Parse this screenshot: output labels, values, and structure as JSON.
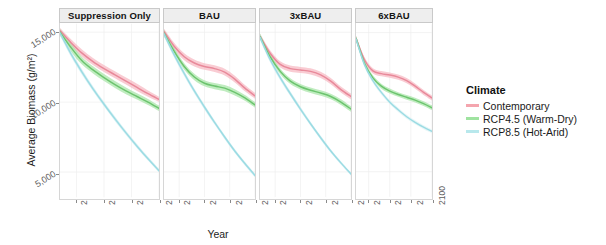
{
  "chart_data": {
    "type": "line",
    "title": "",
    "xlabel": "Year",
    "ylabel": "Average Biomass (g/m²)",
    "xlim": [
      2010,
      2100
    ],
    "ylim": [
      3200,
      15600
    ],
    "xticks": [
      "2025",
      "2050",
      "2075",
      "2100"
    ],
    "xtick_values": [
      2025,
      2050,
      2075,
      2100
    ],
    "yticks": [
      "15,000",
      "10,000",
      "5,000"
    ],
    "ytick_values": [
      15000,
      10000,
      5000
    ],
    "grid": true,
    "legend": {
      "title": "Climate",
      "position": "right",
      "entries": [
        {
          "label": "Contemporary",
          "color": "#f4a5ae"
        },
        {
          "label": "RCP4.5 (Warm-Dry)",
          "color": "#9fe3a0"
        },
        {
          "label": "RCP8.5 (Hot-Arid)",
          "color": "#b8e8ec"
        }
      ]
    },
    "facet_variable": "Harvest Scenario",
    "facets": [
      {
        "label": "Suppression Only",
        "series": [
          {
            "name": "Contemporary",
            "color": "#e8899a",
            "band_color": "#f6b8c2",
            "x": [
              2010,
              2020,
              2030,
              2040,
              2050,
              2060,
              2070,
              2080,
              2090,
              2100
            ],
            "values": [
              15100,
              14250,
              13500,
              12900,
              12400,
              11950,
              11500,
              11050,
              10600,
              10200
            ],
            "band_low": [
              14900,
              14000,
              13250,
              12650,
              12150,
              11700,
              11250,
              10800,
              10380,
              10020
            ],
            "band_high": [
              15300,
              14500,
              13760,
              13160,
              12660,
              12210,
              11760,
              11310,
              10830,
              10390
            ]
          },
          {
            "name": "RCP4.5 (Warm-Dry)",
            "color": "#6cc46e",
            "band_color": "#a8e5a7",
            "x": [
              2010,
              2020,
              2030,
              2040,
              2050,
              2060,
              2070,
              2080,
              2090,
              2100
            ],
            "values": [
              15000,
              13900,
              12950,
              12300,
              11750,
              11250,
              10800,
              10400,
              10000,
              9550
            ],
            "band_low": [
              14750,
              13600,
              12680,
              12050,
              11510,
              11010,
              10570,
              10180,
              9790,
              9360
            ],
            "band_high": [
              15250,
              14200,
              13220,
              12560,
              12000,
              11500,
              11050,
              10640,
              10230,
              9760
            ]
          },
          {
            "name": "RCP8.5 (Hot-Arid)",
            "color": "#9bdbe3",
            "band_color": "#c9ecf0",
            "x": [
              2010,
              2020,
              2030,
              2040,
              2050,
              2060,
              2070,
              2080,
              2090,
              2100
            ],
            "values": [
              14950,
              13450,
              12150,
              10950,
              9850,
              8800,
              7800,
              6850,
              5950,
              5100
            ],
            "band_low": [
              14750,
              13250,
              11960,
              10770,
              9680,
              8640,
              7650,
              6710,
              5820,
              4980
            ],
            "band_high": [
              15150,
              13650,
              12350,
              11140,
              10030,
              8970,
              7960,
              7000,
              6090,
              5230
            ]
          }
        ]
      },
      {
        "label": "BAU",
        "series": [
          {
            "name": "Contemporary",
            "color": "#e8899a",
            "band_color": "#f6b8c2",
            "x": [
              2010,
              2020,
              2030,
              2040,
              2050,
              2060,
              2070,
              2080,
              2090,
              2100
            ],
            "values": [
              15050,
              14000,
              13250,
              12800,
              12550,
              12400,
              12150,
              11650,
              11000,
              10450
            ],
            "band_low": [
              14850,
              13750,
              13000,
              12550,
              12310,
              12160,
              11910,
              11410,
              10780,
              10250
            ],
            "band_high": [
              15250,
              14250,
              13500,
              13050,
              12790,
              12640,
              12390,
              11890,
              11220,
              10650
            ]
          },
          {
            "name": "RCP4.5 (Warm-Dry)",
            "color": "#6cc46e",
            "band_color": "#a8e5a7",
            "x": [
              2010,
              2020,
              2030,
              2040,
              2050,
              2060,
              2070,
              2080,
              2090,
              2100
            ],
            "values": [
              14950,
              13650,
              12550,
              11800,
              11350,
              11150,
              11000,
              10700,
              10300,
              9800
            ],
            "band_low": [
              14700,
              13400,
              12310,
              11570,
              11130,
              10930,
              10780,
              10480,
              10090,
              9600
            ],
            "band_high": [
              15200,
              13900,
              12790,
              12030,
              11570,
              11370,
              11220,
              10920,
              10510,
              10000
            ]
          },
          {
            "name": "RCP8.5 (Hot-Arid)",
            "color": "#9bdbe3",
            "band_color": "#c9ecf0",
            "x": [
              2010,
              2020,
              2030,
              2040,
              2050,
              2060,
              2070,
              2080,
              2090,
              2100
            ],
            "values": [
              14900,
              13400,
              12050,
              10800,
              9650,
              8550,
              7500,
              6500,
              5600,
              4750
            ],
            "band_low": [
              14700,
              13200,
              11860,
              10620,
              9480,
              8390,
              7350,
              6360,
              5470,
              4630
            ],
            "band_high": [
              15100,
              13600,
              12240,
              10980,
              9820,
              8710,
              7650,
              6640,
              5730,
              4870
            ]
          }
        ]
      },
      {
        "label": "3xBAU",
        "series": [
          {
            "name": "Contemporary",
            "color": "#e8899a",
            "band_color": "#f6b8c2",
            "x": [
              2010,
              2020,
              2030,
              2040,
              2050,
              2060,
              2070,
              2080,
              2090,
              2100
            ],
            "values": [
              14700,
              13500,
              12700,
              12400,
              12300,
              12200,
              11950,
              11500,
              10900,
              10400
            ],
            "band_low": [
              14500,
              13280,
              12480,
              12180,
              12080,
              11980,
              11730,
              11280,
              10690,
              10200
            ],
            "band_high": [
              14900,
              13720,
              12920,
              12620,
              12520,
              12420,
              12170,
              11720,
              11110,
              10600
            ]
          },
          {
            "name": "RCP4.5 (Warm-Dry)",
            "color": "#6cc46e",
            "band_color": "#a8e5a7",
            "x": [
              2010,
              2020,
              2030,
              2040,
              2050,
              2060,
              2070,
              2080,
              2090,
              2100
            ],
            "values": [
              14700,
              13250,
              12200,
              11500,
              11100,
              10850,
              10650,
              10400,
              10000,
              9500
            ],
            "band_low": [
              14480,
              13030,
              11990,
              11290,
              10900,
              10650,
              10450,
              10200,
              9800,
              9310
            ],
            "band_high": [
              14920,
              13470,
              12410,
              11710,
              11300,
              11050,
              10850,
              10600,
              10200,
              9690
            ]
          },
          {
            "name": "RCP8.5 (Hot-Arid)",
            "color": "#9bdbe3",
            "band_color": "#c9ecf0",
            "x": [
              2010,
              2020,
              2030,
              2040,
              2050,
              2060,
              2070,
              2080,
              2090,
              2100
            ],
            "values": [
              14650,
              13050,
              11750,
              10600,
              9500,
              8450,
              7450,
              6500,
              5650,
              4850
            ],
            "band_low": [
              14450,
              12860,
              11570,
              10430,
              9340,
              8300,
              7310,
              6370,
              5530,
              4740
            ],
            "band_high": [
              14850,
              13240,
              11930,
              10770,
              9660,
              8600,
              7590,
              6630,
              5770,
              4960
            ]
          }
        ]
      },
      {
        "label": "6xBAU",
        "series": [
          {
            "name": "Contemporary",
            "color": "#e8899a",
            "band_color": "#f6b8c2",
            "x": [
              2010,
              2020,
              2030,
              2040,
              2050,
              2060,
              2070,
              2080,
              2090,
              2100
            ],
            "values": [
              14600,
              13050,
              12250,
              12050,
              11950,
              11800,
              11550,
              11150,
              10700,
              10300
            ],
            "band_low": [
              14420,
              12860,
              12060,
              11860,
              11760,
              11610,
              11360,
              10960,
              10520,
              10120
            ],
            "band_high": [
              14780,
              13240,
              12440,
              12240,
              12140,
              11990,
              11740,
              11340,
              10880,
              10480
            ]
          },
          {
            "name": "RCP4.5 (Warm-Dry)",
            "color": "#6cc46e",
            "band_color": "#a8e5a7",
            "x": [
              2010,
              2020,
              2030,
              2040,
              2050,
              2060,
              2070,
              2080,
              2090,
              2100
            ],
            "values": [
              14600,
              12800,
              11750,
              11150,
              10800,
              10550,
              10350,
              10150,
              9900,
              9600
            ],
            "band_low": [
              14420,
              12620,
              11570,
              10970,
              10620,
              10380,
              10180,
              9980,
              9730,
              9430
            ],
            "band_high": [
              14780,
              12980,
              11930,
              11330,
              10980,
              10720,
              10520,
              10320,
              10070,
              9770
            ]
          },
          {
            "name": "RCP8.5 (Hot-Arid)",
            "color": "#9bdbe3",
            "band_color": "#dcf2f4",
            "x": [
              2010,
              2020,
              2030,
              2040,
              2050,
              2060,
              2070,
              2080,
              2090,
              2100
            ],
            "values": [
              14550,
              12700,
              11550,
              10700,
              10000,
              9450,
              8950,
              8550,
              8200,
              7900
            ],
            "band_low": [
              14380,
              12530,
              11380,
              10540,
              9850,
              9300,
              8810,
              8410,
              8060,
              7770
            ],
            "band_high": [
              14720,
              12870,
              11720,
              10860,
              10150,
              9600,
              9090,
              8690,
              8340,
              8030
            ]
          }
        ]
      }
    ]
  }
}
